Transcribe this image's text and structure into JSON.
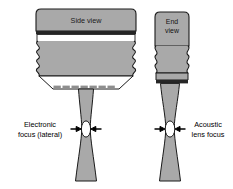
{
  "figure": {
    "background_color": "#ffffff",
    "body_fill": "#a9a9a9",
    "outline_color": "#1a1a1a",
    "dark_band_color": "#262626",
    "focus_fill": "#ffffff",
    "array_element_color": "#8e8e8e"
  },
  "side_view": {
    "label": "Side view",
    "focus_annotation": {
      "line1": "Electronic",
      "line2": "focus (lateral)"
    },
    "array_element_count": 8
  },
  "end_view": {
    "label_line1": "End",
    "label_line2": "view",
    "focus_annotation": {
      "line1": "Acoustic",
      "line2": "lens focus"
    }
  }
}
